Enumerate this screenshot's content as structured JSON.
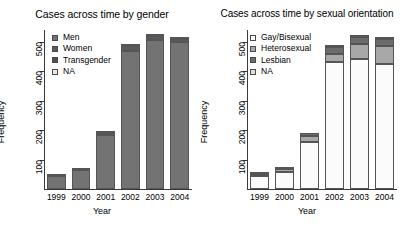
{
  "chart_data": [
    {
      "type": "bar",
      "title": "Cases across time by gender",
      "xlabel": "Year",
      "ylabel": "Frequency",
      "categories": [
        "1999",
        "2000",
        "2001",
        "2002",
        "2003",
        "2004"
      ],
      "yticks": [
        100,
        200,
        300,
        400,
        500
      ],
      "ylim": [
        0,
        540
      ],
      "grid": false,
      "legend_position": "top-left",
      "stacked": true,
      "series": [
        {
          "name": "Men",
          "color": "#737373",
          "values": [
            44,
            63,
            183,
            470,
            505,
            498
          ]
        },
        {
          "name": "Women",
          "color": "#5a5a5a",
          "values": [
            4,
            6,
            6,
            15,
            14,
            13
          ]
        },
        {
          "name": "Transgender",
          "color": "#4d4d4d",
          "values": [
            0,
            0,
            1,
            2,
            2,
            2
          ]
        },
        {
          "name": "NA",
          "color": "#e8e8e8",
          "values": [
            0,
            0,
            0,
            0,
            0,
            0
          ]
        }
      ],
      "totals": [
        48,
        69,
        190,
        487,
        521,
        513
      ]
    },
    {
      "type": "bar",
      "title": "Cases across time by sexual orientation",
      "xlabel": "Year",
      "ylabel": "Frequency",
      "categories": [
        "1999",
        "2000",
        "2001",
        "2002",
        "2003",
        "2004"
      ],
      "yticks": [
        100,
        200,
        300,
        400,
        500
      ],
      "ylim": [
        0,
        540
      ],
      "grid": false,
      "legend_position": "top-left",
      "stacked": true,
      "series": [
        {
          "name": "Gay/Bisexual",
          "color": "#fbfbfb",
          "values": [
            44,
            58,
            160,
            430,
            440,
            425
          ]
        },
        {
          "name": "Heterosexual",
          "color": "#a8a8a8",
          "values": [
            3,
            9,
            20,
            30,
            52,
            60
          ]
        },
        {
          "name": "Lesbian",
          "color": "#6b6b6b",
          "values": [
            1,
            2,
            10,
            22,
            24,
            23
          ]
        },
        {
          "name": "NA",
          "color": "#e0e0e0",
          "values": [
            0,
            0,
            0,
            5,
            5,
            5
          ]
        }
      ],
      "totals": [
        48,
        69,
        190,
        487,
        521,
        513
      ]
    }
  ],
  "left_chart": {
    "title": "Cases across time by gender",
    "ylabel": "Frequency",
    "xlabel": "Year",
    "yticks": [
      "100",
      "200",
      "300",
      "400",
      "500"
    ],
    "xticks": [
      "1999",
      "2000",
      "2001",
      "2002",
      "2003",
      "2004"
    ],
    "legend": [
      {
        "label": "Men"
      },
      {
        "label": "Women"
      },
      {
        "label": "Transgender"
      },
      {
        "label": "NA"
      }
    ]
  },
  "right_chart": {
    "title": "Cases across time by sexual orientation",
    "ylabel": "Frequency",
    "xlabel": "Year",
    "yticks": [
      "100",
      "200",
      "300",
      "400",
      "500"
    ],
    "xticks": [
      "1999",
      "2000",
      "2001",
      "2002",
      "2003",
      "2004"
    ],
    "legend": [
      {
        "label": "Gay/Bisexual"
      },
      {
        "label": "Heterosexual"
      },
      {
        "label": "Lesbian"
      },
      {
        "label": "NA"
      }
    ]
  }
}
